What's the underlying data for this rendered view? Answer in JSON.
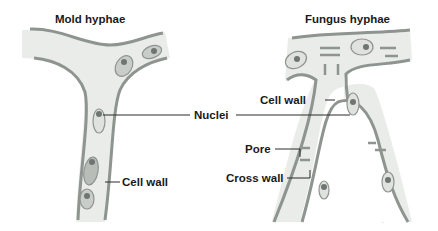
{
  "titles": {
    "left": "Mold hyphae",
    "right": "Fungus hyphae"
  },
  "labels": {
    "nuclei": "Nuclei",
    "cell_wall_left": "Cell wall",
    "cell_wall_right": "Cell wall",
    "pore": "Pore",
    "cross_wall": "Cross wall"
  },
  "colors": {
    "cytoplasm": "#e9ece8",
    "wall": "#8e948f",
    "nucleus_outer": "#c9cdc9",
    "nucleus_inner": "#6f7570",
    "text": "#1a1a1a",
    "leader_line": "#2a2a2a"
  }
}
